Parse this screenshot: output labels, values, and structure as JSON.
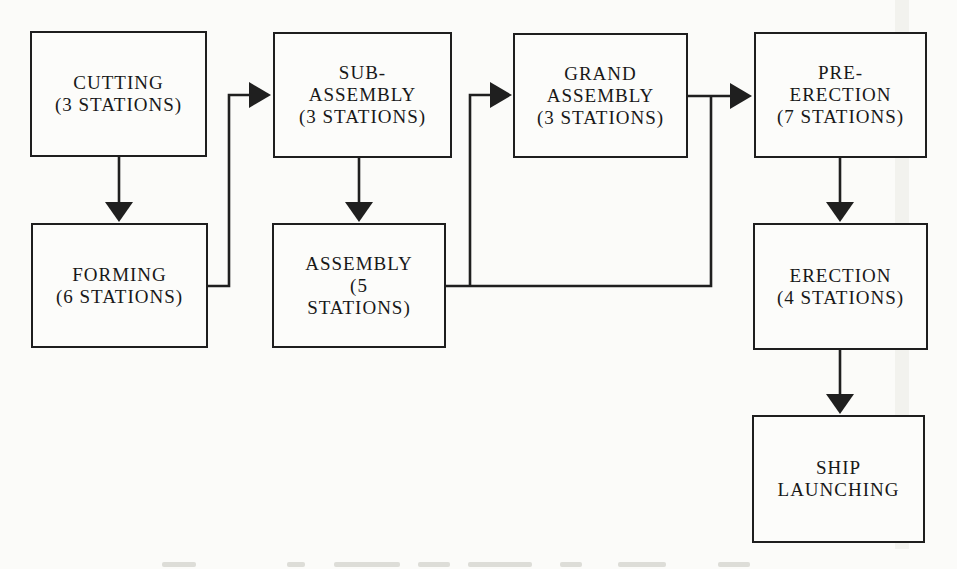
{
  "diagram": {
    "colors": {
      "line": "#1f1f1f",
      "text": "#181818",
      "background": "#fbfbf9",
      "box_fill": "#fcfcfa"
    },
    "boxes": [
      {
        "id": "cutting",
        "lines": [
          "CUTTING",
          "(3 STATIONS)"
        ]
      },
      {
        "id": "sub-assembly",
        "lines": [
          "SUB-",
          "ASSEMBLY",
          "(3 STATIONS)"
        ]
      },
      {
        "id": "grand-assembly",
        "lines": [
          "GRAND",
          "ASSEMBLY",
          "(3 STATIONS)"
        ]
      },
      {
        "id": "pre-erection",
        "lines": [
          "PRE-",
          "ERECTION",
          "(7 STATIONS)"
        ]
      },
      {
        "id": "forming",
        "lines": [
          "FORMING",
          "(6 STATIONS)"
        ]
      },
      {
        "id": "assembly",
        "lines": [
          "ASSEMBLY",
          "(5",
          "STATIONS)"
        ]
      },
      {
        "id": "erection",
        "lines": [
          "ERECTION",
          "(4 STATIONS)"
        ]
      },
      {
        "id": "ship-launching",
        "lines": [
          "SHIP",
          "LAUNCHING"
        ]
      }
    ],
    "edges": [
      {
        "from": "cutting",
        "to": "forming",
        "points": [
          [
            119,
            157
          ],
          [
            119,
            204
          ]
        ],
        "arrow": {
          "tip": [
            119,
            222
          ],
          "dir": "down"
        }
      },
      {
        "from": "sub-assembly",
        "to": "assembly",
        "points": [
          [
            359,
            158
          ],
          [
            359,
            204
          ]
        ],
        "arrow": {
          "tip": [
            359,
            222
          ],
          "dir": "down"
        }
      },
      {
        "from": "pre-erection",
        "to": "erection",
        "points": [
          [
            840,
            158
          ],
          [
            840,
            204
          ]
        ],
        "arrow": {
          "tip": [
            840,
            222
          ],
          "dir": "down"
        }
      },
      {
        "from": "erection",
        "to": "ship-launching",
        "points": [
          [
            840,
            350
          ],
          [
            840,
            396
          ]
        ],
        "arrow": {
          "tip": [
            840,
            414
          ],
          "dir": "down"
        }
      },
      {
        "from": "forming",
        "to": "sub-assembly",
        "points": [
          [
            208,
            286
          ],
          [
            229,
            286
          ],
          [
            229,
            95
          ],
          [
            251,
            95
          ]
        ],
        "arrow": {
          "tip": [
            271,
            95
          ],
          "dir": "right"
        }
      },
      {
        "from": "assembly",
        "to": "grand-assembly",
        "points": [
          [
            470,
            287
          ],
          [
            470,
            95
          ],
          [
            492,
            95
          ]
        ],
        "arrow": {
          "tip": [
            512,
            95
          ],
          "dir": "right"
        }
      },
      {
        "from": "assembly",
        "to": "pre-erection",
        "points": [
          [
            446,
            286
          ],
          [
            711,
            286
          ],
          [
            711,
            96
          ]
        ],
        "arrow": null
      },
      {
        "from": "grand-assembly",
        "to": "pre-erection",
        "points": [
          [
            688,
            96
          ],
          [
            732,
            96
          ]
        ],
        "arrow": {
          "tip": [
            752,
            96
          ],
          "dir": "right"
        }
      }
    ]
  }
}
